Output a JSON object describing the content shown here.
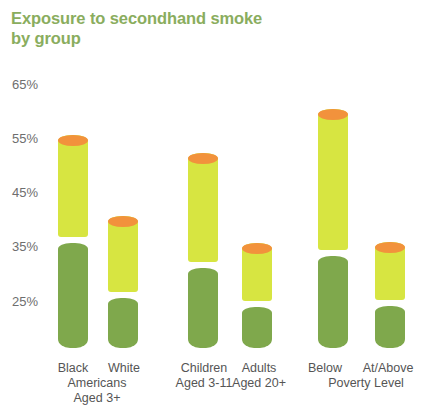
{
  "chart_data": {
    "type": "bar",
    "title": "Exposure to secondhand smoke\nby group",
    "xlabel": "",
    "ylabel": "",
    "ylim": [
      20,
      65
    ],
    "grid": false,
    "legend": null,
    "value_suffix": "%",
    "categories": [
      "Black",
      "White",
      "Children\nAged 3-11",
      "Adults\nAged 20+",
      "Below",
      "At/Above"
    ],
    "group_labels": [
      "Americans\nAged 3+",
      "Poverty Level"
    ],
    "values": [
      55.7,
      40.9,
      52.5,
      35.9,
      60.5,
      36.0
    ],
    "yticks": [
      65,
      55,
      45,
      35,
      25
    ],
    "ytick_labels": [
      "65%",
      "55%",
      "45%",
      "35%",
      "25%"
    ],
    "series": [
      {
        "name": "Percent exposed to secondhand smoke",
        "values": [
          55.7,
          40.9,
          52.5,
          35.9,
          60.5,
          36.0
        ]
      }
    ]
  },
  "colors": {
    "title": "#8aad5e",
    "tip": "#f2923c",
    "body": "#d7e541",
    "filter": "#7fa84c",
    "axis_text": "#6e6e6e",
    "label_text": "#555555",
    "background": "#ffffff"
  },
  "axis": {
    "tick_0": "65%",
    "tick_1": "55%",
    "tick_2": "45%",
    "tick_3": "35%",
    "tick_4": "25%"
  },
  "bars": [
    {
      "label": "Black",
      "value": 55.7
    },
    {
      "label": "White",
      "value": 40.9
    },
    {
      "label": "Children\nAged 3-11",
      "value": 52.5
    },
    {
      "label": "Adults\nAged 20+",
      "value": 35.9
    },
    {
      "label": "Below",
      "value": 60.5
    },
    {
      "label": "At/Above",
      "value": 36.0
    }
  ],
  "groups": [
    {
      "label": "Americans\nAged 3+"
    },
    {
      "label": "Poverty Level"
    }
  ]
}
